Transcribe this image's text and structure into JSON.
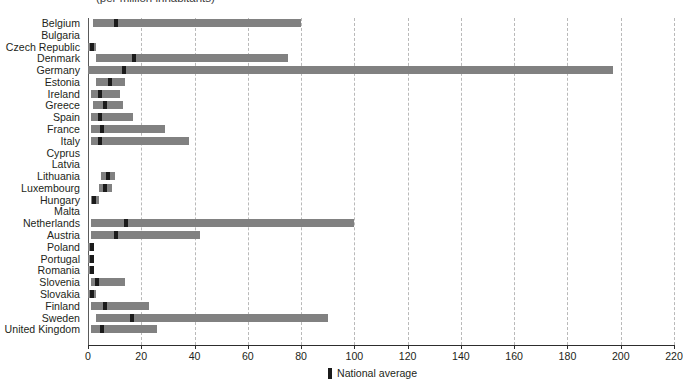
{
  "subtitle": "(per million inhabitants)",
  "legend": {
    "marker_label": "National average",
    "marker_color": "#1b1b1b",
    "range_color": "#818181"
  },
  "axis": {
    "ticks": [
      0,
      20,
      40,
      60,
      80,
      100,
      120,
      140,
      160,
      180,
      200,
      220
    ],
    "min": 0,
    "max": 220
  },
  "chart_data": {
    "type": "bar",
    "orientation": "horizontal",
    "title": "",
    "subtitle": "(per million inhabitants)",
    "xlabel": "",
    "ylabel": "",
    "xlim": [
      0,
      220
    ],
    "grid": true,
    "legend_position": "bottom",
    "series": [
      {
        "name": "Range",
        "type": "range-bar",
        "color": "#818181"
      },
      {
        "name": "National average",
        "type": "marker",
        "color": "#1b1b1b"
      }
    ],
    "categories": [
      "Belgium",
      "Bulgaria",
      "Czech Republic",
      "Denmark",
      "Germany",
      "Estonia",
      "Ireland",
      "Greece",
      "Spain",
      "France",
      "Italy",
      "Cyprus",
      "Latvia",
      "Lithuania",
      "Luxembourg",
      "Hungary",
      "Malta",
      "Netherlands",
      "Austria",
      "Poland",
      "Portugal",
      "Romania",
      "Slovenia",
      "Slovakia",
      "Finland",
      "Sweden",
      "United Kingdom"
    ],
    "rows": [
      {
        "category": "Belgium",
        "range_min": 2,
        "range_max": 80,
        "national_average": 10
      },
      {
        "category": "Bulgaria",
        "range_min": 0,
        "range_max": 0,
        "national_average": null
      },
      {
        "category": "Czech Republic",
        "range_min": 0,
        "range_max": 3,
        "national_average": 1
      },
      {
        "category": "Denmark",
        "range_min": 3,
        "range_max": 75,
        "national_average": 17
      },
      {
        "category": "Germany",
        "range_min": 0,
        "range_max": 197,
        "national_average": 13
      },
      {
        "category": "Estonia",
        "range_min": 3,
        "range_max": 14,
        "national_average": 8
      },
      {
        "category": "Ireland",
        "range_min": 1,
        "range_max": 12,
        "national_average": 4
      },
      {
        "category": "Greece",
        "range_min": 2,
        "range_max": 13,
        "national_average": 6
      },
      {
        "category": "Spain",
        "range_min": 1,
        "range_max": 17,
        "national_average": 4
      },
      {
        "category": "France",
        "range_min": 1,
        "range_max": 29,
        "national_average": 5
      },
      {
        "category": "Italy",
        "range_min": 1,
        "range_max": 38,
        "national_average": 4
      },
      {
        "category": "Cyprus",
        "range_min": 0,
        "range_max": 0,
        "national_average": null
      },
      {
        "category": "Latvia",
        "range_min": 0,
        "range_max": 0,
        "national_average": null
      },
      {
        "category": "Lithuania",
        "range_min": 5,
        "range_max": 10,
        "national_average": 7
      },
      {
        "category": "Luxembourg",
        "range_min": 4,
        "range_max": 9,
        "national_average": 6
      },
      {
        "category": "Hungary",
        "range_min": 1,
        "range_max": 4,
        "national_average": 2
      },
      {
        "category": "Malta",
        "range_min": 0,
        "range_max": 0,
        "national_average": null
      },
      {
        "category": "Netherlands",
        "range_min": 1,
        "range_max": 100,
        "national_average": 14
      },
      {
        "category": "Austria",
        "range_min": 1,
        "range_max": 42,
        "national_average": 10
      },
      {
        "category": "Poland",
        "range_min": 0,
        "range_max": 2,
        "national_average": 1
      },
      {
        "category": "Portugal",
        "range_min": 0,
        "range_max": 2,
        "national_average": 1
      },
      {
        "category": "Romania",
        "range_min": 0,
        "range_max": 2,
        "national_average": 1
      },
      {
        "category": "Slovenia",
        "range_min": 1,
        "range_max": 14,
        "national_average": 3
      },
      {
        "category": "Slovakia",
        "range_min": 0,
        "range_max": 3,
        "national_average": 1
      },
      {
        "category": "Finland",
        "range_min": 1,
        "range_max": 23,
        "national_average": 6
      },
      {
        "category": "Sweden",
        "range_min": 3,
        "range_max": 90,
        "national_average": 16
      },
      {
        "category": "United Kingdom",
        "range_min": 1,
        "range_max": 26,
        "national_average": 5
      }
    ]
  }
}
